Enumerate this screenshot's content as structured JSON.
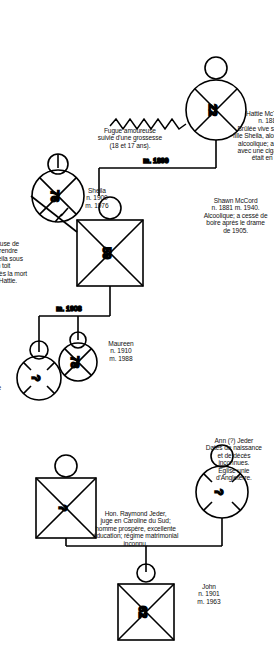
{
  "document": {
    "title": "Génogramme familial McCord / Jeder",
    "language": "fr",
    "orientation": "rotated-90"
  },
  "annotations": {
    "hattie_note": "Hattie McTeague McCord\nn. 1883 m. 1905.\nBrûlée vive sous les yeux de sa\nfille Sheila, alors âgée de cinq ans;\nalcoolique; a mis le feu à son lit\navec une cigarette, alors qu'elle\nétait en état d'ébriété.",
    "shawn_note": "Shawn McCord\nn. 1881 m. 1940.\nAlcoolique; a cessé de\nboire après le drame\nde 1905.",
    "fugue_note": "Fugue amoureuse\nsuivie d'une grossesse\n(18 et 17 ans).",
    "sheila_note": "Sheila\nn. 1900\nm. 1976",
    "refus_note": "Refuse de\nreprendre\nSheila sous\nson toit\naprès la mort\nde Hattie.",
    "maureen_note": "Maureen\nn. 1910\nm. 1988",
    "deuxieme_epouse_note": "2ᵉ épouse\n(?)",
    "ann_note": "Ann (?) Jeder\nDates de naissance\net de décès\ninconnues.\nÉglise unie\nd'Angleterre.",
    "raymond_note": "Hon. Raymond Jeder,\njuge en Caroline du Sud;\nhomme prospère, excellente\néducation; régime matrimonial\ninconnu.",
    "john_note": "John\nn. 1901\nm. 1963"
  },
  "marriage_labels": {
    "m_1899": "m. 1899",
    "m_1908": "m. 1908"
  },
  "nodes": {
    "hattie": {
      "label": "22",
      "shape": "circle",
      "deceased": true
    },
    "shawn": {
      "label": "59",
      "shape": "square",
      "deceased": true
    },
    "sheila": {
      "label": "76",
      "shape": "circle",
      "deceased": true
    },
    "maureen": {
      "label": "78",
      "shape": "circle",
      "deceased": true
    },
    "second_wife": {
      "label": "?",
      "shape": "circle",
      "deceased": true
    },
    "ann": {
      "label": "?",
      "shape": "circle",
      "deceased": true
    },
    "raymond": {
      "label": "?",
      "shape": "square",
      "deceased": true
    },
    "john": {
      "label": "62",
      "shape": "square",
      "deceased": true
    }
  },
  "colors": {
    "ink": "#111111",
    "stroke": "#000000",
    "background": "#ffffff"
  }
}
